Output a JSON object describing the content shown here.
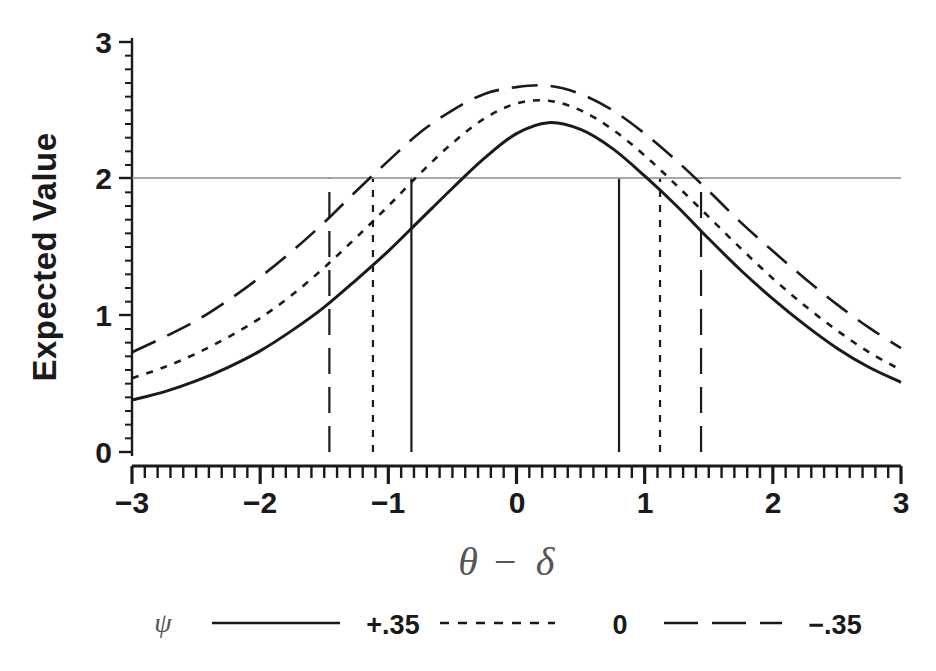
{
  "chart_data": {
    "type": "line",
    "title": "",
    "xlabel": "θ − δ",
    "ylabel": "Expected Value",
    "xlim": [
      -3,
      3
    ],
    "ylim": [
      0,
      3
    ],
    "xticks": [
      -3,
      -2,
      -1,
      0,
      1,
      2,
      3
    ],
    "xticklabels": [
      "−3",
      "−2",
      "−1",
      "0",
      "1",
      "2",
      "3"
    ],
    "yticks": [
      0,
      1,
      2,
      3
    ],
    "yticklabels": [
      "0",
      "1",
      "2",
      "3"
    ],
    "grid": false,
    "minor_ticks_x": true,
    "minor_ticks_y": true,
    "legend_position": "below",
    "legend_title": "ψ",
    "reference_line": {
      "orientation": "horizontal",
      "value": 2,
      "label": "2"
    },
    "x": [
      -3,
      -2.75,
      -2.5,
      -2.25,
      -2,
      -1.75,
      -1.5,
      -1.25,
      -1,
      -0.75,
      -0.5,
      -0.25,
      0,
      0.25,
      0.5,
      0.75,
      1,
      1.25,
      1.5,
      1.75,
      2,
      2.25,
      2.5,
      2.75,
      3
    ],
    "series": [
      {
        "name": "+.35",
        "style": "solid",
        "color": "#1a1a1a",
        "peak": 2.41,
        "endpoints": [
          0.38,
          0.38
        ],
        "crossings_at_2": [
          -0.82,
          0.8
        ],
        "values": [
          0.38,
          0.44,
          0.52,
          0.62,
          0.74,
          0.89,
          1.06,
          1.26,
          1.47,
          1.7,
          1.93,
          2.15,
          2.33,
          2.41,
          2.36,
          2.22,
          2.02,
          1.8,
          1.56,
          1.33,
          1.12,
          0.93,
          0.76,
          0.62,
          0.51
        ]
      },
      {
        "name": "0",
        "style": "dashed",
        "color": "#1a1a1a",
        "peak": 2.57,
        "endpoints": [
          0.54,
          0.49
        ],
        "crossings_at_2": [
          -1.12,
          1.12
        ],
        "values": [
          0.54,
          0.62,
          0.72,
          0.84,
          0.98,
          1.15,
          1.35,
          1.57,
          1.8,
          2.04,
          2.26,
          2.44,
          2.55,
          2.57,
          2.5,
          2.36,
          2.17,
          1.95,
          1.72,
          1.49,
          1.27,
          1.07,
          0.89,
          0.73,
          0.6
        ]
      },
      {
        "name": "−.35",
        "style": "longdash",
        "color": "#1a1a1a",
        "peak": 2.68,
        "endpoints": [
          0.73,
          0.67
        ],
        "crossings_at_2": [
          -1.46,
          1.44
        ],
        "values": [
          0.73,
          0.84,
          0.96,
          1.11,
          1.28,
          1.47,
          1.68,
          1.91,
          2.13,
          2.34,
          2.5,
          2.62,
          2.67,
          2.68,
          2.62,
          2.5,
          2.33,
          2.13,
          1.91,
          1.68,
          1.47,
          1.27,
          1.08,
          0.91,
          0.76
        ]
      }
    ],
    "vertical_reference_lines": [
      {
        "x": -1.46,
        "style": "longdash",
        "series": "−.35",
        "from": 0,
        "to": 2
      },
      {
        "x": -1.12,
        "style": "dashed",
        "series": "0",
        "from": 0,
        "to": 2
      },
      {
        "x": -0.82,
        "style": "solid",
        "series": "+.35",
        "from": 0,
        "to": 2
      },
      {
        "x": 0.8,
        "style": "solid",
        "series": "+.35",
        "from": 0,
        "to": 2
      },
      {
        "x": 1.12,
        "style": "dashed",
        "series": "0",
        "from": 0,
        "to": 2
      },
      {
        "x": 1.44,
        "style": "longdash",
        "series": "−.35",
        "from": 0,
        "to": 2
      }
    ]
  },
  "axis": {
    "y_label": "Expected Value",
    "x_label_theta": "θ",
    "x_label_minus": "−",
    "x_label_delta": "δ",
    "y_tick_3": "3",
    "y_tick_2": "2",
    "y_tick_1": "1",
    "y_tick_0": "0",
    "x_tick_m3": "−3",
    "x_tick_m2": "−2",
    "x_tick_m1": "−1",
    "x_tick_0": "0",
    "x_tick_1": "1",
    "x_tick_2": "2",
    "x_tick_3": "3"
  },
  "legend": {
    "symbol": "ψ",
    "entries": [
      {
        "label": "+.35",
        "style": "solid"
      },
      {
        "label": "0",
        "style": "dashed"
      },
      {
        "label": "−.35",
        "style": "longdash"
      }
    ],
    "entry_0_label": "+.35",
    "entry_1_label": "0",
    "entry_2_label": "−.35"
  },
  "colors": {
    "line": "#1a1a1a",
    "reference": "#888888",
    "background": "#ffffff"
  }
}
